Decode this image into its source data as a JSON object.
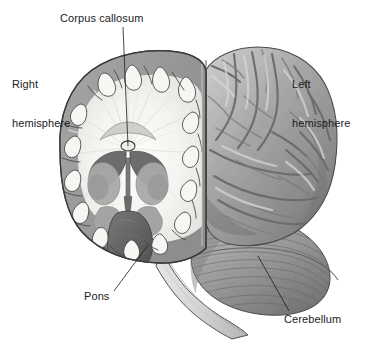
{
  "figure": {
    "background_color": "#ffffff",
    "width": 370,
    "height": 347
  },
  "labels": {
    "corpus_callosum": "Corpus callosum",
    "right_hemisphere_line1": "Right",
    "right_hemisphere_line2": "hemisphere",
    "left_hemisphere_line1": "Left",
    "left_hemisphere_line2": "hemisphere",
    "pons": "Pons",
    "cerebellum": "Cerebellum"
  },
  "annotations": [
    {
      "name": "corpus-callosum",
      "text": "Corpus callosum",
      "leader_from": [
        123,
        27
      ],
      "leader_to": [
        128,
        146
      ]
    },
    {
      "name": "right-hemisphere",
      "text": "Right hemisphere",
      "leader_from": null,
      "leader_to": null
    },
    {
      "name": "left-hemisphere",
      "text": "Left hemisphere",
      "leader_from": null,
      "leader_to": null
    },
    {
      "name": "pons",
      "text": "Pons",
      "leader_from": [
        114,
        291
      ],
      "leader_to": [
        148,
        245
      ]
    },
    {
      "name": "cerebellum",
      "text": "Cerebellum",
      "leader_from": [
        289,
        311
      ],
      "leader_to": [
        258,
        256
      ]
    }
  ],
  "colors": {
    "background": "#ffffff",
    "outline": "#3a3a3a",
    "cortex_gray": "#9b9b9b",
    "cortex_gray_dark": "#7f7f7f",
    "white_matter": "#f7f7f5",
    "white_matter_shade": "#e2e2de",
    "ventricle_dark": "#6a6a6a",
    "brainstem_dark": "#5e5e5e",
    "lateral_surface": "#a8a8a8",
    "lateral_highlight": "#d8d8d8",
    "lateral_shadow": "#6f6f6f",
    "cerebellum": "#9a9a9a",
    "cerebellum_shadow": "#6b6b6b",
    "cord_light": "#d2d2d0",
    "leader_line": "#1c1c1c",
    "text": "#1c1c1c"
  },
  "structures": [
    "right hemisphere coronal cut face",
    "cerebral cortex gray matter ribbon",
    "cerebral white matter with radiating fibers",
    "corpus callosum",
    "lateral ventricles",
    "basal ganglia",
    "thalamus / midline diencephalon",
    "left hemisphere lateral surface gyri and sulci",
    "pons",
    "cerebellum with folia",
    "brainstem and spinal cord"
  ]
}
